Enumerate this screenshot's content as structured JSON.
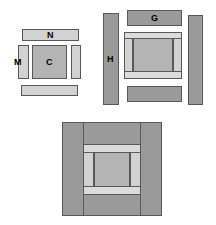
{
  "diagram": {
    "background_color": "#ffffff",
    "outline_color": "#595959",
    "palette": {
      "dark": "#9a9a9a",
      "mid": "#b4b4b4",
      "light": "#d2d2d2",
      "pale": "#dcdcdc"
    },
    "labels": {
      "c": "C",
      "m": "M",
      "n": "N",
      "g": "G",
      "h": "H"
    },
    "groups": [
      {
        "name": "left-exploded-group",
        "parts": [
          {
            "name": "top-bar-n",
            "label": "N",
            "shape": "horizontal-bar",
            "fill": "light"
          },
          {
            "name": "left-bar-m",
            "label": "M",
            "shape": "vertical-bar",
            "fill": "light"
          },
          {
            "name": "center-panel-c",
            "label": "C",
            "shape": "square-panel",
            "fill": "mid"
          },
          {
            "name": "right-bar",
            "label": "",
            "shape": "vertical-bar",
            "fill": "light"
          },
          {
            "name": "bottom-bar",
            "label": "",
            "shape": "horizontal-bar",
            "fill": "light"
          }
        ]
      },
      {
        "name": "right-exploded-group",
        "parts": [
          {
            "name": "left-bar-h",
            "label": "H",
            "shape": "vertical-bar",
            "fill": "dark"
          },
          {
            "name": "top-bar-g",
            "label": "G",
            "shape": "horizontal-bar",
            "fill": "dark"
          },
          {
            "name": "right-bar",
            "label": "",
            "shape": "vertical-bar",
            "fill": "dark"
          },
          {
            "name": "bottom-bar",
            "label": "",
            "shape": "horizontal-bar",
            "fill": "dark"
          },
          {
            "name": "center-subassembly",
            "label": "",
            "shape": "framed-panel",
            "fill": "mid"
          }
        ]
      },
      {
        "name": "bottom-assembled-group",
        "parts": [
          {
            "name": "outer-frame",
            "label": "",
            "shape": "frame",
            "fill": "dark"
          },
          {
            "name": "inner-subassembly",
            "label": "",
            "shape": "framed-panel",
            "fill": "mid"
          }
        ]
      }
    ]
  }
}
